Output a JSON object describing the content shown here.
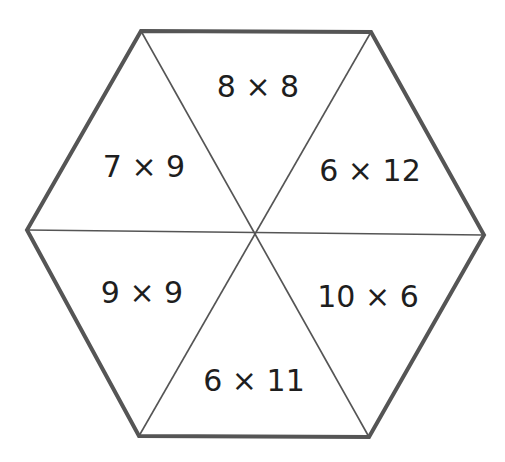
{
  "diagram": {
    "shape": "hexagon",
    "outline_color": "#555555",
    "divider_color": "#555555",
    "segments": [
      {
        "position": "top",
        "label": "8 × 8"
      },
      {
        "position": "upper-left",
        "label": "7 × 9"
      },
      {
        "position": "upper-right",
        "label": "6 × 12"
      },
      {
        "position": "lower-left",
        "label": "9 × 9"
      },
      {
        "position": "lower-right",
        "label": "10 × 6"
      },
      {
        "position": "bottom",
        "label": "6 × 11"
      }
    ]
  }
}
